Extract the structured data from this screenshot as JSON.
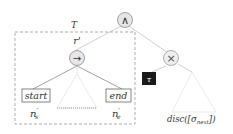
{
  "diagram": {
    "root": {
      "symbol": "∧",
      "label": "and-operator"
    },
    "subtree": {
      "name": "T",
      "root_label": "r'",
      "operator": "→"
    },
    "start_node": {
      "label": "start",
      "annotation_main": "n",
      "annotation_sub": "s"
    },
    "end_node": {
      "label": "end",
      "annotation_main": "n",
      "annotation_sub": "e"
    },
    "xor_node": {
      "symbol": "×"
    },
    "tau_node": {
      "symbol": "τ"
    },
    "disc_label": {
      "prefix": "disc([σ",
      "sub": "next",
      "suffix": "])"
    }
  },
  "colors": {
    "node_fill": "#e6e6e6",
    "edge": "#b8b8b8",
    "dash": "#9a9a9a",
    "tau_fill": "#1a1a1a"
  }
}
